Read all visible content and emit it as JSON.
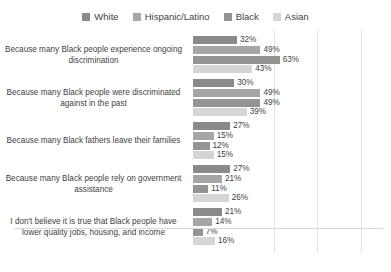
{
  "chart_data": {
    "type": "bar",
    "orientation": "horizontal",
    "title": "",
    "xlabel": "",
    "ylabel": "",
    "xlim": [
      0,
      128
    ],
    "grid": true,
    "gridline_values": [
      49,
      80,
      112
    ],
    "value_label_format": "%",
    "legend_position": "top-center",
    "categories": [
      "Because many Black people experience ongoing discrimination",
      "Because many Black people were discriminated against in the past",
      "Because many Black fathers leave their families",
      "Because many Black people rely on government assistance",
      "I don't believe it is true that Black people have lower quality jobs, housing, and income"
    ],
    "series": [
      {
        "name": "White",
        "color": "#8a8a8a",
        "values": [
          32,
          30,
          27,
          27,
          21
        ]
      },
      {
        "name": "Hispanic/Latino",
        "color": "#a6a6a6",
        "values": [
          49,
          49,
          15,
          21,
          14
        ]
      },
      {
        "name": "Black",
        "color": "#949494",
        "values": [
          63,
          49,
          12,
          11,
          7
        ]
      },
      {
        "name": "Asian",
        "color": "#d5d5d5",
        "values": [
          43,
          39,
          15,
          26,
          16
        ]
      }
    ],
    "value_labels": [
      [
        "32%",
        "49%",
        "63%",
        "43%"
      ],
      [
        "30%",
        "49%",
        "49%",
        "39%"
      ],
      [
        "27%",
        "15%",
        "12%",
        "15%"
      ],
      [
        "27%",
        "21%",
        "11%",
        "26%"
      ],
      [
        "21%",
        "14%",
        "7%",
        "16%"
      ]
    ]
  }
}
